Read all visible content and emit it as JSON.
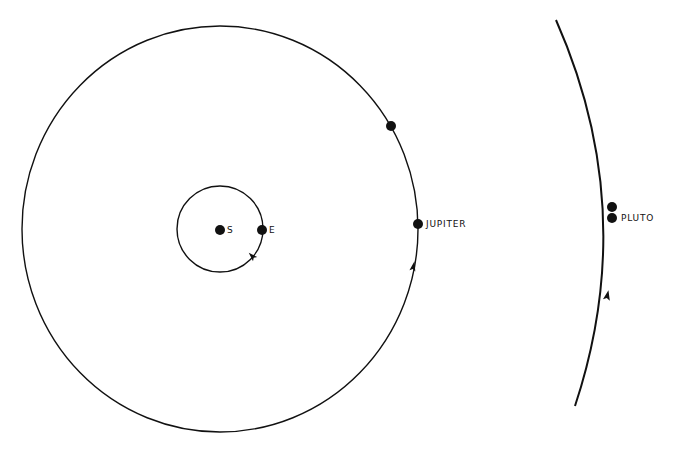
{
  "diagram": {
    "colors": {
      "ink": "#111111",
      "background": "#ffffff"
    },
    "labels": {
      "sun": "S",
      "earth": "E",
      "jupiter": "JUPITER",
      "pluto": "PLUTO"
    },
    "bodies": [
      {
        "name": "Sun",
        "label": "S",
        "x": 220,
        "y": 230
      },
      {
        "name": "Earth",
        "label": "E",
        "x": 262,
        "y": 230
      },
      {
        "name": "Jupiter",
        "label": "JUPITER",
        "x": 418,
        "y": 224
      },
      {
        "name": "Jupiter (earlier position)",
        "label": "",
        "x": 391,
        "y": 126
      },
      {
        "name": "Pluto",
        "label": "PLUTO",
        "x": 612,
        "y": 218
      },
      {
        "name": "Pluto (earlier position)",
        "label": "",
        "x": 612,
        "y": 207
      }
    ],
    "orbits": [
      {
        "name": "Earth orbit",
        "cx": 220,
        "cy": 229,
        "r": 43,
        "direction": "counterclockwise"
      },
      {
        "name": "Jupiter orbit",
        "cx": 220,
        "cy": 229,
        "r": 200,
        "direction": "counterclockwise"
      },
      {
        "name": "Pluto orbit (arc)",
        "direction": "counterclockwise"
      }
    ]
  }
}
